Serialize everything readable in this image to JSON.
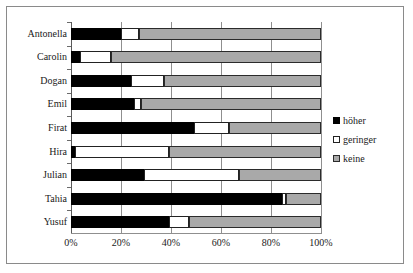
{
  "chart_data": {
    "type": "bar",
    "orientation": "horizontal",
    "stacked": true,
    "stacked_percent": true,
    "title": "",
    "subtitle": "",
    "xlabel": "",
    "ylabel": "",
    "xlim": [
      0,
      100
    ],
    "xticks": [
      0,
      20,
      40,
      60,
      80,
      100
    ],
    "xtick_labels": [
      "0%",
      "20%",
      "40%",
      "60%",
      "80%",
      "100%"
    ],
    "grid": true,
    "grid_axis": "x",
    "legend_position": "right",
    "categories": [
      "Antonella",
      "Carolin",
      "Dogan",
      "Emil",
      "Firat",
      "Hira",
      "Julian",
      "Tahia",
      "Yusuf"
    ],
    "series": [
      {
        "name": "höher",
        "color": "#000000",
        "values": [
          20,
          3.5,
          24,
          25,
          49,
          1.5,
          29,
          84.5,
          39
        ]
      },
      {
        "name": "geringer",
        "color": "#ffffff",
        "values": [
          7,
          12.5,
          13,
          3,
          14,
          37.5,
          38,
          1.5,
          8
        ]
      },
      {
        "name": "keine",
        "color": "#a9a9a9",
        "values": [
          73,
          84,
          63,
          72,
          37,
          61,
          33,
          14,
          53
        ]
      }
    ]
  },
  "legend": {
    "items": [
      {
        "label": "höher",
        "swatch": "black-square-icon"
      },
      {
        "label": "geringer",
        "swatch": "white-square-icon"
      },
      {
        "label": "keine",
        "swatch": "gray-square-icon"
      }
    ]
  }
}
